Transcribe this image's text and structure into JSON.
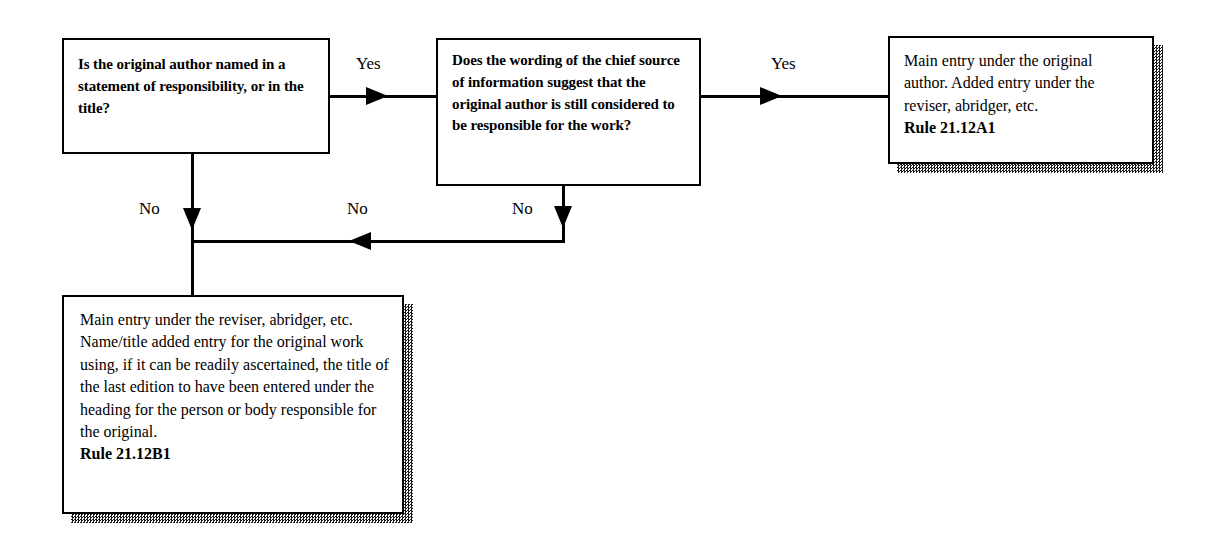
{
  "diagram": {
    "nodes": {
      "question_author_named": {
        "type": "decision",
        "text": "Is the original author named in a statement of responsibility, or in the title?"
      },
      "question_wording_suggests": {
        "type": "decision",
        "text": "Does the wording of the chief source of information suggest that the original author is still considered to be responsible for the work?"
      },
      "outcome_original_author": {
        "type": "terminal",
        "text": "Main entry under the original author. Added entry under the reviser, abridger, etc.",
        "rule": "Rule 21.12A1"
      },
      "outcome_reviser": {
        "type": "terminal",
        "text": "Main entry under the reviser, abridger, etc. Name/title added entry for the original work using, if it can be readily ascertained, the title of the last edition to have been entered under the heading for the person or body responsible for the original.",
        "rule": "Rule 21.12B1"
      }
    },
    "edges": {
      "q1_to_q2": {
        "label": "Yes"
      },
      "q2_to_outcome_a": {
        "label": "Yes"
      },
      "q1_no": {
        "label": "No"
      },
      "merge_no": {
        "label": "No"
      },
      "q2_no": {
        "label": "No"
      }
    },
    "colors": {
      "line": "#000000",
      "box_fill": "#ffffff",
      "shadow": "#1a1a1a",
      "background": "#ffffff"
    }
  }
}
